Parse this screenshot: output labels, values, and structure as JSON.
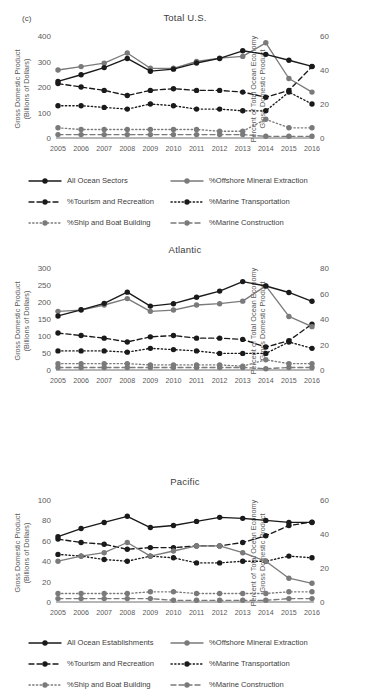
{
  "figure": {
    "panel_tag": "(c)",
    "width": 370,
    "height": 698
  },
  "axis_labels": {
    "left": "Gross Domestic Product\n(Billions of Dollars)",
    "right": "Percent of Total Ocean Economy\nGross Domestic Product"
  },
  "colors": {
    "black": "#1a1a1a",
    "gray": "#7a7a7a",
    "axis": "#6e6e6e",
    "text": "#3d3d3d",
    "tick_text": "#5a5a5a"
  },
  "series_styles": {
    "all_ocean": {
      "color": "#1a1a1a",
      "dash": "none",
      "name": "all-ocean-line"
    },
    "offshore_mineral": {
      "color": "#7a7a7a",
      "dash": "none",
      "name": "offshore-mineral-line"
    },
    "tourism": {
      "color": "#1a1a1a",
      "dash": "dashed",
      "name": "tourism-line"
    },
    "marine_transportation": {
      "color": "#1a1a1a",
      "dash": "dotted",
      "name": "marine-transportation-line"
    },
    "ship_boat": {
      "color": "#7a7a7a",
      "dash": "dotted",
      "name": "ship-boat-line"
    },
    "marine_construction": {
      "color": "#7a7a7a",
      "dash": "dashed",
      "name": "marine-construction-line"
    }
  },
  "panels": [
    {
      "id": "total-us",
      "title": "Total U.S.",
      "tag": "(c)",
      "legend": [
        {
          "key": "all_ocean",
          "label": "All Ocean Sectors"
        },
        {
          "key": "offshore_mineral",
          "label": "%Offshore Mineral Extraction"
        },
        {
          "key": "tourism",
          "label": "%Tourism and Recreation"
        },
        {
          "key": "marine_transportation",
          "label": "%Marine Transportation"
        },
        {
          "key": "ship_boat",
          "label": "%Ship and Boat Building"
        },
        {
          "key": "marine_construction",
          "label": "%Marine Construction"
        }
      ],
      "chart_data": {
        "type": "line",
        "title": "Total U.S.",
        "xlabel": "",
        "ylabel": "Gross Domestic Product (Billions of Dollars)",
        "ylabel_right": "Percent of Total Ocean Economy Gross Domestic Product",
        "x": [
          2005,
          2006,
          2007,
          2008,
          2009,
          2010,
          2011,
          2012,
          2013,
          2014,
          2015,
          2016
        ],
        "xtick_labels": [
          "2005",
          "2006",
          "2007",
          "2008",
          "2009",
          "2010",
          "2011",
          "2012",
          "2013",
          "2014",
          "2015",
          "2016"
        ],
        "ylim": [
          0,
          400
        ],
        "yticks": [
          0,
          100,
          200,
          300,
          400
        ],
        "ytick_labels": [
          "0",
          "100",
          "200",
          "300",
          "400"
        ],
        "ylim_right": [
          0,
          60
        ],
        "yticks_right": [
          0,
          20,
          40,
          60
        ],
        "ytick_labels_right": [
          "0",
          "20",
          "40",
          "60"
        ],
        "grid": false,
        "legend_position": "below",
        "series": [
          {
            "name": "All Ocean Sectors",
            "key": "all_ocean",
            "axis": "left",
            "values": [
              222,
              248,
              276,
              312,
              262,
              270,
              294,
              312,
              342,
              328,
              305,
              281
            ]
          },
          {
            "name": "%Offshore Mineral Extraction",
            "key": "offshore_mineral",
            "axis": "right",
            "values": [
              40,
              42,
              44,
              50,
              41,
              41,
              45,
              47,
              48,
              56,
              35,
              27
            ]
          },
          {
            "name": "%Tourism and Recreation",
            "key": "tourism",
            "axis": "right",
            "values": [
              32,
              30,
              28,
              25,
              28,
              29,
              28,
              28,
              27,
              24,
              28,
              42
            ]
          },
          {
            "name": "%Marine Transportation",
            "key": "marine_transportation",
            "axis": "right",
            "values": [
              19,
              19,
              18,
              17,
              20,
              19,
              17,
              17,
              16,
              16,
              27,
              20
            ]
          },
          {
            "name": "%Ship and Boat Building",
            "key": "ship_boat",
            "axis": "right",
            "values": [
              6,
              5,
              5,
              5,
              5,
              5,
              5,
              4,
              4,
              11,
              6,
              6
            ]
          },
          {
            "name": "%Marine Construction",
            "key": "marine_construction",
            "axis": "right",
            "values": [
              2,
              2,
              2,
              2,
              2,
              2,
              2,
              2,
              2,
              1,
              1,
              1
            ]
          }
        ]
      }
    },
    {
      "id": "atlantic",
      "title": "Atlantic",
      "tag": "",
      "legend": [
        {
          "key": "all_ocean",
          "label": "All Ocean Establishments"
        },
        {
          "key": "offshore_mineral",
          "label": "%Offshore Mineral Extraction"
        },
        {
          "key": "tourism",
          "label": "%Tourism and Recreation"
        },
        {
          "key": "marine_transportation",
          "label": "%Marine Transportation"
        },
        {
          "key": "ship_boat",
          "label": "%Ship and Boat Building"
        },
        {
          "key": "marine_construction",
          "label": "%Marine Construction"
        }
      ],
      "chart_data": {
        "type": "line",
        "title": "Atlantic",
        "xlabel": "",
        "ylabel": "Gross Domestic Product (Billions of Dollars)",
        "ylabel_right": "Percent of Total Ocean Economy Gross Domestic Product",
        "x": [
          2005,
          2006,
          2007,
          2008,
          2009,
          2010,
          2011,
          2012,
          2013,
          2014,
          2015,
          2016
        ],
        "xtick_labels": [
          "2005",
          "2006",
          "2007",
          "2008",
          "2009",
          "2010",
          "2011",
          "2012",
          "2013",
          "2014",
          "2015",
          "2016"
        ],
        "ylim": [
          0,
          300
        ],
        "yticks": [
          0,
          50,
          100,
          150,
          200,
          250,
          300
        ],
        "ytick_labels": [
          "0",
          "50",
          "100",
          "150",
          "200",
          "250",
          "300"
        ],
        "ylim_right": [
          0,
          80
        ],
        "yticks_right": [
          0,
          20,
          40,
          60,
          80
        ],
        "ytick_labels_right": [
          "0",
          "20",
          "40",
          "60",
          "80"
        ],
        "grid": false,
        "legend_position": "below",
        "series": [
          {
            "name": "All Ocean Establishments",
            "key": "all_ocean",
            "axis": "left",
            "values": [
              159,
              177,
              196,
              229,
              188,
              195,
              214,
              232,
              260,
              247,
              228,
              202
            ]
          },
          {
            "name": "%Offshore Mineral Extraction",
            "key": "offshore_mineral",
            "axis": "right",
            "values": [
              46,
              47,
              51,
              56,
              46,
              47,
              51,
              52,
              54,
              66,
              42,
              34
            ]
          },
          {
            "name": "%Tourism and Recreation",
            "key": "tourism",
            "axis": "right",
            "values": [
              29,
              27,
              25,
              22,
              26,
              27,
              25,
              25,
              24,
              18,
              23,
              36
            ]
          },
          {
            "name": "%Marine Transportation",
            "key": "marine_transportation",
            "axis": "right",
            "values": [
              15,
              15,
              15,
              14,
              17,
              16,
              15,
              13,
              13,
              13,
              22,
              17
            ]
          },
          {
            "name": "%Ship and Boat Building",
            "key": "ship_boat",
            "axis": "right",
            "values": [
              5,
              5,
              5,
              5,
              4,
              4,
              4,
              4,
              3,
              8,
              5,
              5
            ]
          },
          {
            "name": "%Marine Construction",
            "key": "marine_construction",
            "axis": "right",
            "values": [
              2,
              2,
              2,
              2,
              2,
              2,
              2,
              2,
              2,
              1,
              2,
              2
            ]
          }
        ]
      }
    },
    {
      "id": "pacific",
      "title": "Pacific",
      "tag": "",
      "legend": [
        {
          "key": "all_ocean",
          "label": "All Ocean Establishments"
        },
        {
          "key": "tourism",
          "label": "%Tourism and Recreation"
        },
        {
          "key": "offshore_mineral",
          "label": "%Offshore Mineral Extraction"
        },
        {
          "key": "marine_transportation",
          "label": "%Marine Transportation"
        },
        {
          "key": "ship_boat",
          "label": "%Ship and Boat Building"
        },
        {
          "key": "marine_construction",
          "label": "%Marine Construction"
        }
      ],
      "chart_data": {
        "type": "line",
        "title": "Pacific",
        "xlabel": "",
        "ylabel": "Gross Domestic Product (Billions of Dollars)",
        "ylabel_right": "Percent of Total Ocean Economy Gross Domestic Product",
        "x": [
          2005,
          2006,
          2007,
          2008,
          2009,
          2010,
          2011,
          2012,
          2013,
          2014,
          2015,
          2016
        ],
        "xtick_labels": [
          "2005",
          "2006",
          "2007",
          "2008",
          "2009",
          "2010",
          "2011",
          "2012",
          "2013",
          "2014",
          "2015",
          "2016"
        ],
        "ylim": [
          0,
          100
        ],
        "yticks": [
          0,
          20,
          40,
          60,
          80,
          100
        ],
        "ytick_labels": [
          "0",
          "20",
          "40",
          "60",
          "80",
          "100"
        ],
        "ylim_right": [
          0,
          60
        ],
        "yticks_right": [
          0,
          20,
          40,
          60
        ],
        "ytick_labels_right": [
          "0",
          "20",
          "40",
          "60"
        ],
        "grid": false,
        "legend_position": "below",
        "series": [
          {
            "name": "All Ocean Establishments",
            "key": "all_ocean",
            "axis": "left",
            "values": [
              64,
              72,
              78,
              84,
              73,
              75,
              79,
              83,
              82,
              80,
              78,
              78
            ]
          },
          {
            "name": "%Tourism and Recreation",
            "key": "tourism",
            "axis": "right",
            "values": [
              37,
              35,
              34,
              31,
              32,
              32,
              33,
              33,
              35,
              39,
              45,
              47
            ]
          },
          {
            "name": "%Offshore Mineral Extraction",
            "key": "offshore_mineral",
            "axis": "right",
            "values": [
              24,
              27,
              29,
              35,
              27,
              30,
              33,
              33,
              29,
              24,
              14,
              11
            ]
          },
          {
            "name": "%Marine Transportation",
            "key": "marine_transportation",
            "axis": "right",
            "values": [
              28,
              27,
              25,
              24,
              27,
              26,
              23,
              23,
              24,
              24,
              27,
              26
            ]
          },
          {
            "name": "%Ship and Boat Building",
            "key": "ship_boat",
            "axis": "right",
            "values": [
              5,
              5,
              5,
              5,
              6,
              6,
              5,
              5,
              5,
              5,
              6,
              6
            ]
          },
          {
            "name": "%Marine Construction",
            "key": "marine_construction",
            "axis": "right",
            "values": [
              2,
              2,
              2,
              2,
              2,
              1,
              1,
              1,
              1,
              1,
              2,
              2
            ]
          }
        ]
      }
    }
  ]
}
